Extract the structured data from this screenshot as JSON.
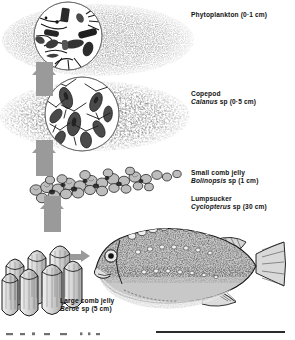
{
  "figure": {
    "type": "marine-food-chain-illustration",
    "medium": "stippled pen-and-ink scientific illustration",
    "flow_direction": "bottom-to-top energy transfer shown by grey block arrows"
  },
  "labels": {
    "phytoplankton": {
      "common_name": "Phytoplankton",
      "size": "(0·1 cm)",
      "line1": "Phytoplankton (0·1 cm)"
    },
    "copepod": {
      "common_name": "Copepod",
      "genus": "Calanus",
      "qualifier": "sp",
      "size": "(0·5 cm)",
      "line1": "Copepod",
      "line2_genus": "Calanus",
      "line2_rest": " sp  (0·5 cm)"
    },
    "small_comb_jelly": {
      "common_name": "Small comb jelly",
      "genus": "Bolinopsis",
      "qualifier": "sp",
      "size": "(1 cm)",
      "line1": "Small comb jelly",
      "line2_genus": "Bolinopsis",
      "line2_rest": " sp  (1 cm)"
    },
    "lumpsucker": {
      "common_name": "Lumpsucker",
      "genus": "Cyclopterus",
      "qualifier": "sp",
      "size": "(30 cm)",
      "line1": "Lumpsucker",
      "line2_genus": "Cyclopterus",
      "line2_rest": " sp  (30 cm)"
    },
    "large_comb_jelly": {
      "common_name": "Large comb jelly",
      "genus": "Beroe",
      "qualifier": "sp",
      "size": "(5 cm)",
      "line1": "Large comb jelly",
      "line2_genus": "Beroe",
      "line2_rest": " sp  (5 cm)"
    }
  },
  "trophic_levels": [
    {
      "rank": 1,
      "name": "Phytoplankton",
      "size_cm": 0.1
    },
    {
      "rank": 2,
      "name": "Copepod (Calanus sp)",
      "size_cm": 0.5
    },
    {
      "rank": 3,
      "name": "Small comb jelly (Bolinopsis sp)",
      "size_cm": 1
    },
    {
      "rank": 4,
      "name": "Large comb jelly (Beroe sp)",
      "size_cm": 5
    },
    {
      "rank": 5,
      "name": "Lumpsucker (Cyclopterus sp)",
      "size_cm": 30
    }
  ],
  "arrows": [
    {
      "name": "phytoplankton-to-copepod",
      "direction": "up"
    },
    {
      "name": "copepod-to-small-comb-jelly",
      "direction": "up"
    },
    {
      "name": "small-comb-jelly-to-large-comb-jelly",
      "direction": "up"
    },
    {
      "name": "large-comb-jelly-to-lumpsucker",
      "direction": "right"
    }
  ],
  "colors": {
    "arrow_grey": "#9a9a9a",
    "ink": "#111111",
    "paper": "#ffffff",
    "rule": "#2b2b2b"
  }
}
